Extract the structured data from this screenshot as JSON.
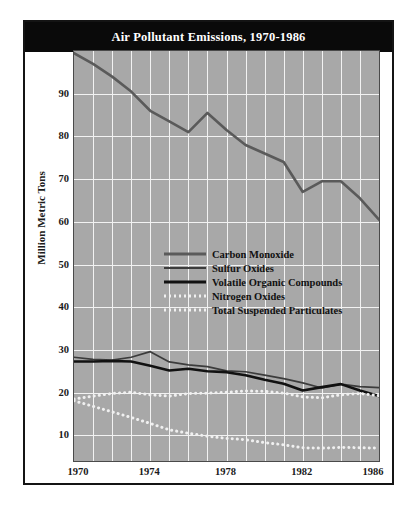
{
  "chart_data": {
    "type": "line",
    "title": "Air Pollutant Emissions, 1970-1986",
    "xlabel": "",
    "ylabel": "Million Metric Tons",
    "xlim": [
      1970,
      1986
    ],
    "ylim": [
      4,
      100
    ],
    "grid": true,
    "legend_position": "center-left inside plot",
    "x": [
      1970,
      1971,
      1972,
      1973,
      1974,
      1975,
      1976,
      1977,
      1978,
      1979,
      1980,
      1981,
      1982,
      1983,
      1984,
      1985,
      1986
    ],
    "xticks": [
      "1970",
      "1974",
      "1978",
      "1982",
      "1986"
    ],
    "yticks": [
      "10",
      "20",
      "30",
      "40",
      "50",
      "60",
      "70",
      "80",
      "90"
    ],
    "series": [
      {
        "name": "Carbon Monoxide",
        "style": "solid",
        "color": "#5a5a5a",
        "width": 2.6,
        "values": [
          99.5,
          97.0,
          94.0,
          90.5,
          86.0,
          83.5,
          81.0,
          85.5,
          81.5,
          78.0,
          76.0,
          74.0,
          67.0,
          69.5,
          69.5,
          65.5,
          60.5
        ]
      },
      {
        "name": "Sulfur Oxides",
        "style": "solid",
        "color": "#3c3c3c",
        "width": 1.7,
        "values": [
          28.3,
          27.8,
          27.6,
          28.3,
          29.6,
          27.2,
          26.5,
          26.1,
          25.1,
          24.9,
          24.1,
          23.3,
          22.3,
          21.1,
          22.0,
          21.4,
          21.2
        ]
      },
      {
        "name": "Volatile Organic Compounds",
        "style": "solid",
        "color": "#111111",
        "width": 2.6,
        "values": [
          27.3,
          27.3,
          27.4,
          27.3,
          26.3,
          25.2,
          25.6,
          25.0,
          24.8,
          24.1,
          23.0,
          22.1,
          20.5,
          21.3,
          22.0,
          20.5,
          19.2
        ]
      },
      {
        "name": "Nitrogen Oxides",
        "style": "dotted",
        "color": "#f0f0f0",
        "width": 3.0,
        "values": [
          18.5,
          19.2,
          19.8,
          20.1,
          19.5,
          19.2,
          19.8,
          19.9,
          20.1,
          20.4,
          20.3,
          19.9,
          19.0,
          18.8,
          19.5,
          19.8,
          19.3
        ]
      },
      {
        "name": "Total Suspended Particulates",
        "style": "dotted",
        "color": "#f0f0f0",
        "width": 3.0,
        "values": [
          18.1,
          16.8,
          15.5,
          14.2,
          12.8,
          11.3,
          10.5,
          9.8,
          9.3,
          9.0,
          8.3,
          7.8,
          7.1,
          7.0,
          7.2,
          7.1,
          7.0
        ]
      }
    ]
  },
  "figure": {
    "title": "Air Pollutant Emissions, 1970-1986",
    "ylabel": "Million Metric Tons"
  },
  "legend": {
    "items": [
      {
        "label": "Carbon Monoxide"
      },
      {
        "label": "Sulfur Oxides"
      },
      {
        "label": "Volatile Organic Compounds"
      },
      {
        "label": "Nitrogen Oxides"
      },
      {
        "label": "Total Suspended Particulates"
      }
    ]
  }
}
